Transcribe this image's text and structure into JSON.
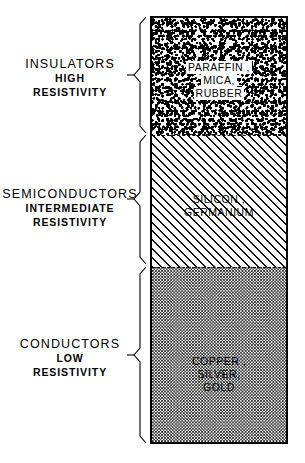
{
  "diagram": {
    "ink_color": "#000000",
    "background_color": "#ffffff",
    "bands": [
      {
        "id": "insulators",
        "category": "INSULATORS",
        "property_line1": "HIGH",
        "property_line2": "RESISTIVITY",
        "texture": "dense-coarse-stipple",
        "materials": [
          "PARAFFIN ,",
          "MICA,",
          "RUBBER"
        ]
      },
      {
        "id": "semiconductors",
        "category": "SEMICONDUCTORS",
        "property_line1": "INTERMEDIATE",
        "property_line2": "RESISTIVITY",
        "texture": "diagonal-hatch",
        "materials": [
          "SILICON ,",
          "GERMANIUM"
        ]
      },
      {
        "id": "conductors",
        "category": "CONDUCTORS",
        "property_line1": "LOW",
        "property_line2": "RESISTIVITY",
        "texture": "fine-dot-stipple",
        "materials": [
          "COPPER ,",
          "SILVER,",
          "GOLD"
        ]
      }
    ]
  }
}
